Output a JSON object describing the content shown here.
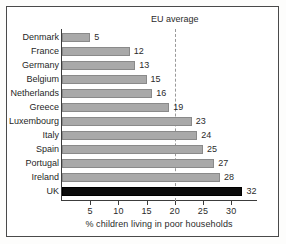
{
  "chart_data": {
    "type": "bar",
    "orientation": "horizontal",
    "title": "",
    "xlabel": "% children living in poor households",
    "ylabel": "",
    "categories": [
      "Denmark",
      "France",
      "Germany",
      "Belgium",
      "Netherlands",
      "Greece",
      "Luxembourg",
      "Italy",
      "Spain",
      "Portugal",
      "Ireland",
      "UK"
    ],
    "values": [
      5,
      12,
      13,
      15,
      16,
      19,
      23,
      24,
      25,
      27,
      28,
      32
    ],
    "xlim": [
      0,
      34.5
    ],
    "xticks": [
      5,
      10,
      15,
      20,
      25,
      30
    ],
    "xtick_labels": [
      "5",
      "10",
      "15",
      "20",
      "25",
      "30"
    ],
    "grid": false,
    "legend": false,
    "bar_color": "#a9a9a9",
    "bar_edge_color": "#8a8a8a",
    "highlight_category": "UK",
    "highlight_color": "#0c0c0c",
    "annotations": [
      {
        "name": "eu-average",
        "label": "EU average",
        "value": 20,
        "style": "dashed-vertical-line",
        "color": "#9a9a9a"
      }
    ],
    "value_labels": [
      "5",
      "12",
      "13",
      "15",
      "16",
      "19",
      "23",
      "24",
      "25",
      "27",
      "28",
      "32"
    ]
  },
  "frame": {
    "border_color": "#4a4a4a",
    "background": "#ffffff"
  }
}
